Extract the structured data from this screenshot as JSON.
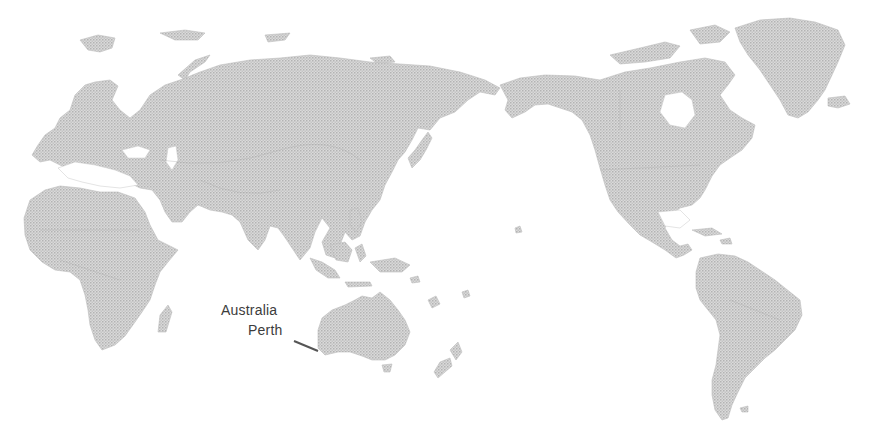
{
  "map": {
    "projection": "Pacific-centered world map",
    "style": "grayscale halftone",
    "colors": {
      "land_fill": "#d6d6d6",
      "land_dot": "#b0b0b0",
      "water": "#ffffff",
      "annotation_text": "#3c3c3c",
      "leader_line": "#555555"
    }
  },
  "annotation": {
    "country": "Australia",
    "city": "Perth"
  }
}
